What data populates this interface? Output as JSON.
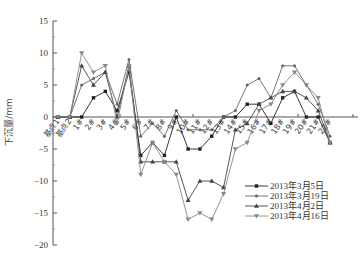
{
  "chart_data": {
    "type": "line",
    "title": "",
    "xlabel": "",
    "ylabel": "下沉量/mm",
    "ylim": [
      -20,
      15
    ],
    "yticks": [
      15,
      10,
      5,
      0,
      -5,
      -10,
      -15,
      -20
    ],
    "grid": false,
    "legend_position": "lower right",
    "categories": [
      "基点1",
      "基点2",
      "1#",
      "2#",
      "3#",
      "4#",
      "5#",
      "6#",
      "7#",
      "8#",
      "9#",
      "10#",
      "11#",
      "12#",
      "13#",
      "14#",
      "15#",
      "16#",
      "17#",
      "18#",
      "19#",
      "20#",
      "21#",
      "22#"
    ],
    "series": [
      {
        "name": "2013年3月5日",
        "marker": "square",
        "values": [
          0,
          0,
          0,
          3,
          4,
          1,
          7,
          -6,
          -4,
          -6,
          0,
          -5,
          -5,
          -3,
          0,
          0,
          2,
          2,
          -1,
          3,
          4,
          0,
          0,
          -4
        ]
      },
      {
        "name": "2013年3月19日",
        "marker": "dot",
        "values": [
          0,
          0,
          5,
          6,
          7,
          2,
          9,
          -3,
          -1,
          -3,
          1,
          -2,
          -2,
          -2,
          0,
          1,
          5,
          6,
          3,
          8,
          8,
          5,
          2,
          -3
        ]
      },
      {
        "name": "2013年4月2日",
        "marker": "triangle-up",
        "values": [
          0,
          0,
          8,
          5,
          7,
          0,
          8,
          -7,
          -7,
          -7,
          -7,
          -13,
          -10,
          -10,
          -11,
          -2,
          -1,
          2,
          3,
          4,
          4,
          3,
          1,
          -4
        ]
      },
      {
        "name": "2013年4月16日",
        "marker": "triangle-down",
        "values": [
          0,
          0,
          10,
          7,
          8,
          -1,
          8,
          -9,
          -4,
          -7,
          -9,
          -16,
          -15,
          -16,
          -12,
          -5,
          -4,
          1,
          2,
          5,
          7,
          5,
          3,
          -4
        ]
      }
    ]
  }
}
